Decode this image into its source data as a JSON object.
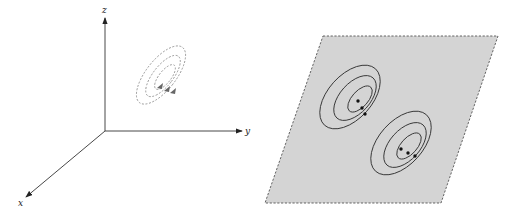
{
  "left_panel": {
    "axes": {
      "x_label": "x",
      "y_label": "y",
      "z_label": "z"
    },
    "contours": {
      "style": "dashed",
      "count": 3,
      "arrows": 3
    }
  },
  "right_panel": {
    "plane": {
      "style": "dashed-border",
      "fill": "#d4d4d4"
    },
    "contour_groups": [
      {
        "name": "upper-left",
        "rings": 3,
        "arrows": 3
      },
      {
        "name": "lower-right",
        "rings": 3,
        "arrows": 3
      }
    ]
  },
  "colors": {
    "axis": "#333333",
    "dashed_contour": "#8a8a8a",
    "solid_contour": "#333333",
    "plane_fill": "#d4d4d4",
    "plane_border": "#555555"
  }
}
